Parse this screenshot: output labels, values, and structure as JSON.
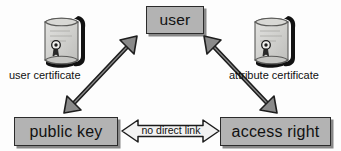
{
  "diagram": {
    "background_color": "#fdfdfd",
    "node_fill_color": "#b3b3b3",
    "node_border_color": "#2b2b2b",
    "solid_arrow_fill_color": "#8a8a8a",
    "hollow_arrow_fill_color": "#f2f2f2",
    "text_color": "#111111"
  },
  "nodes": [
    {
      "id": "user",
      "label": "user"
    },
    {
      "id": "public_key",
      "label": "public key"
    },
    {
      "id": "access_right",
      "label": "access right"
    }
  ],
  "icons": [
    {
      "id": "user_certificate",
      "icon_name": "certificate-scroll-icon",
      "caption": "user certificate"
    },
    {
      "id": "attribute_certificate",
      "icon_name": "certificate-scroll-icon",
      "caption": "attribute certificate"
    }
  ],
  "connectors": [
    {
      "id": "user_to_public_key",
      "style": "solid-gray-double-arrow",
      "from": "public key",
      "to": "user",
      "label": ""
    },
    {
      "id": "user_to_access_right",
      "style": "solid-gray-double-arrow",
      "from": "user",
      "to": "access right",
      "label": ""
    },
    {
      "id": "public_key_to_access_right",
      "style": "hollow-outline-double-arrow",
      "from": "public key",
      "to": "access right",
      "label": "no direct link"
    }
  ]
}
